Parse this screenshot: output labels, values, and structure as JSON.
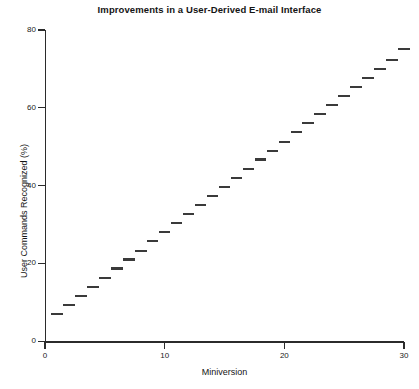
{
  "chart_data": {
    "type": "scatter",
    "title": "Improvements in a User-Derived E-mail Interface",
    "xlabel": "Miniversion",
    "ylabel": "User Commands Recognized (%)",
    "xlim": [
      0,
      30
    ],
    "ylim": [
      0,
      80
    ],
    "xticks": [
      0,
      10,
      20,
      30
    ],
    "yticks": [
      0,
      20,
      40,
      60,
      80
    ],
    "grid": false,
    "legend": null,
    "marker_style": "horizontal-dash",
    "x": [
      1,
      2,
      3,
      4,
      5,
      6,
      7,
      8,
      9,
      10,
      11,
      12,
      13,
      14,
      15,
      16,
      17,
      18,
      19,
      20,
      21,
      22,
      23,
      24,
      25,
      26,
      27,
      28,
      29,
      30
    ],
    "values": [
      7,
      9.3,
      11.7,
      14,
      16.3,
      18.7,
      21,
      23.3,
      25.7,
      28,
      30.3,
      32.7,
      35,
      37.3,
      39.7,
      42,
      44.3,
      46.7,
      49,
      51.3,
      53.7,
      56,
      58.3,
      60.7,
      63,
      65.3,
      67.7,
      70,
      72.3,
      75
    ],
    "series": [
      {
        "name": "User Commands Recognized (%)",
        "values": [
          7,
          9.3,
          11.7,
          14,
          16.3,
          18.7,
          21,
          23.3,
          25.7,
          28,
          30.3,
          32.7,
          35,
          37.3,
          39.7,
          42,
          44.3,
          46.7,
          49,
          51.3,
          53.7,
          56,
          58.3,
          60.7,
          63,
          65.3,
          67.7,
          70,
          72.3,
          75
        ]
      }
    ],
    "color": "#3a3a3a"
  },
  "axes": {
    "y_tick_labels": [
      "0",
      "20",
      "40",
      "60",
      "80"
    ],
    "x_tick_labels": [
      "0",
      "10",
      "20",
      "30"
    ]
  }
}
